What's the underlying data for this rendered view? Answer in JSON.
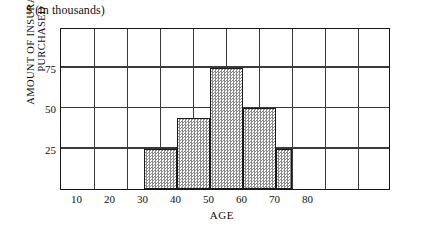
{
  "chart_data": {
    "type": "bar",
    "title": "$ (in thousands)",
    "xlabel": "AGE",
    "ylabel_line1": "AMOUNT OF INSURANCE",
    "ylabel_line2": "PURCHASED",
    "xlim": [
      5,
      105
    ],
    "ylim": [
      0,
      100
    ],
    "xticks": [
      10,
      20,
      30,
      40,
      50,
      60,
      70,
      80
    ],
    "yticks": [
      25,
      50,
      75
    ],
    "x_gridlines": [
      15,
      25,
      35,
      45,
      55,
      65,
      75,
      85,
      95
    ],
    "y_gridlines": [
      25,
      50,
      75
    ],
    "grid": true,
    "legend": "none",
    "bin_edges": [
      30,
      40,
      50,
      60,
      70,
      75
    ],
    "bars": [
      {
        "label": "30-40",
        "x_start": 30,
        "x_end": 40,
        "value": 25
      },
      {
        "label": "40-50",
        "x_start": 40,
        "x_end": 50,
        "value": 44
      },
      {
        "label": "50-60",
        "x_start": 50,
        "x_end": 60,
        "value": 75
      },
      {
        "label": "60-70",
        "x_start": 60,
        "x_end": 70,
        "value": 50
      },
      {
        "label": "70-75",
        "x_start": 70,
        "x_end": 75,
        "value": 25
      }
    ],
    "categories": [
      "30-40",
      "40-50",
      "50-60",
      "60-70",
      "70-75"
    ],
    "values": [
      25,
      44,
      75,
      50,
      25
    ],
    "bar_fill": "#cfcfcf",
    "bar_edge": "#1a1a1a",
    "axis_color": "#151515",
    "grid_color": "#3a3a3a"
  }
}
